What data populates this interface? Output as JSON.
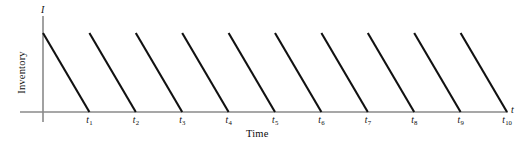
{
  "chart_data": {
    "type": "line",
    "title": "",
    "subtitle": "",
    "xlabel": "Time",
    "ylabel": "Inventory",
    "x_axis_symbol": "t",
    "y_axis_symbol": "I",
    "grid": false,
    "legend": null,
    "xlim": [
      0,
      10
    ],
    "ylim": [
      0,
      1
    ],
    "tick_labels": [
      "t",
      "t",
      "t",
      "t",
      "t",
      "t",
      "t",
      "t",
      "t",
      "t"
    ],
    "tick_subscripts": [
      "1",
      "2",
      "3",
      "4",
      "5",
      "6",
      "7",
      "8",
      "9",
      "10"
    ],
    "tick_values": [
      1,
      2,
      3,
      4,
      5,
      6,
      7,
      8,
      9,
      10
    ],
    "peak_value": 1,
    "baseline_value": 0,
    "cycles": 10,
    "series": [
      {
        "name": "Inventory level",
        "color": "#111111",
        "segments": [
          {
            "x": [
              0,
              1
            ],
            "y": [
              1,
              0
            ]
          },
          {
            "x": [
              1,
              2
            ],
            "y": [
              1,
              0
            ]
          },
          {
            "x": [
              2,
              3
            ],
            "y": [
              1,
              0
            ]
          },
          {
            "x": [
              3,
              4
            ],
            "y": [
              1,
              0
            ]
          },
          {
            "x": [
              4,
              5
            ],
            "y": [
              1,
              0
            ]
          },
          {
            "x": [
              5,
              6
            ],
            "y": [
              1,
              0
            ]
          },
          {
            "x": [
              6,
              7
            ],
            "y": [
              1,
              0
            ]
          },
          {
            "x": [
              7,
              8
            ],
            "y": [
              1,
              0
            ]
          },
          {
            "x": [
              8,
              9
            ],
            "y": [
              1,
              0
            ]
          },
          {
            "x": [
              9,
              10
            ],
            "y": [
              1,
              0
            ]
          }
        ]
      }
    ]
  },
  "colors": {
    "background": "#ffffff",
    "axis": "#8a8a8a",
    "line": "#111111",
    "text": "#0d0d0d"
  },
  "geometry": {
    "origin_x": 43,
    "baseline_y": 112,
    "axis_top_y": 16,
    "axis_bottom_y": 122,
    "axis_right_x": 508,
    "peak_y": 33,
    "cycle_width": 46.4
  }
}
